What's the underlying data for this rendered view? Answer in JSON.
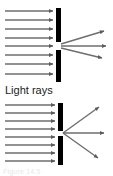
{
  "figure": {
    "caption_label": "Light rays",
    "footer_label": "Figure 14.5",
    "colors": {
      "barrier": "#000000",
      "ray": "#6e6e6e",
      "ray_dark": "#4a4a4a",
      "text": "#1a1a1a",
      "background": "#ffffff"
    },
    "panels": [
      {
        "id": "wide-slit",
        "name": "Wide slit panel",
        "barrier_x": 56,
        "barrier_width": 5,
        "barrier_segments": [
          {
            "y_top": 8,
            "y_bottom": 42
          },
          {
            "y_top": 50,
            "y_bottom": 82
          }
        ],
        "slit_center_y": 46,
        "slit_width": 8,
        "incoming_rays": {
          "count": 8,
          "x_start": 5,
          "x_end": 54,
          "y_values": [
            11,
            20,
            29,
            38,
            46,
            55,
            64,
            74
          ]
        },
        "outgoing_rays": [
          {
            "label": "up",
            "x1": 61,
            "y1": 44,
            "x2": 106,
            "y2": 31
          },
          {
            "label": "straight",
            "x1": 61,
            "y1": 46,
            "x2": 108,
            "y2": 46
          },
          {
            "label": "down",
            "x1": 61,
            "y1": 48,
            "x2": 104,
            "y2": 58
          }
        ]
      },
      {
        "id": "narrow-slit",
        "name": "Narrow slit panel",
        "barrier_x": 58,
        "barrier_width": 5,
        "barrier_segments": [
          {
            "y_top": 103,
            "y_bottom": 131
          },
          {
            "y_top": 136,
            "y_bottom": 165
          }
        ],
        "slit_center_y": 133,
        "slit_width": 5,
        "incoming_rays": {
          "count": 8,
          "x_start": 5,
          "x_end": 56,
          "y_values": [
            105,
            113,
            121,
            129,
            137,
            145,
            153,
            161
          ]
        },
        "outgoing_rays": [
          {
            "label": "up",
            "x1": 62,
            "y1": 133,
            "x2": 101,
            "y2": 106
          },
          {
            "label": "straight",
            "x1": 62,
            "y1": 133,
            "x2": 106,
            "y2": 133
          },
          {
            "label": "down",
            "x1": 62,
            "y1": 133,
            "x2": 100,
            "y2": 159
          }
        ]
      }
    ]
  }
}
